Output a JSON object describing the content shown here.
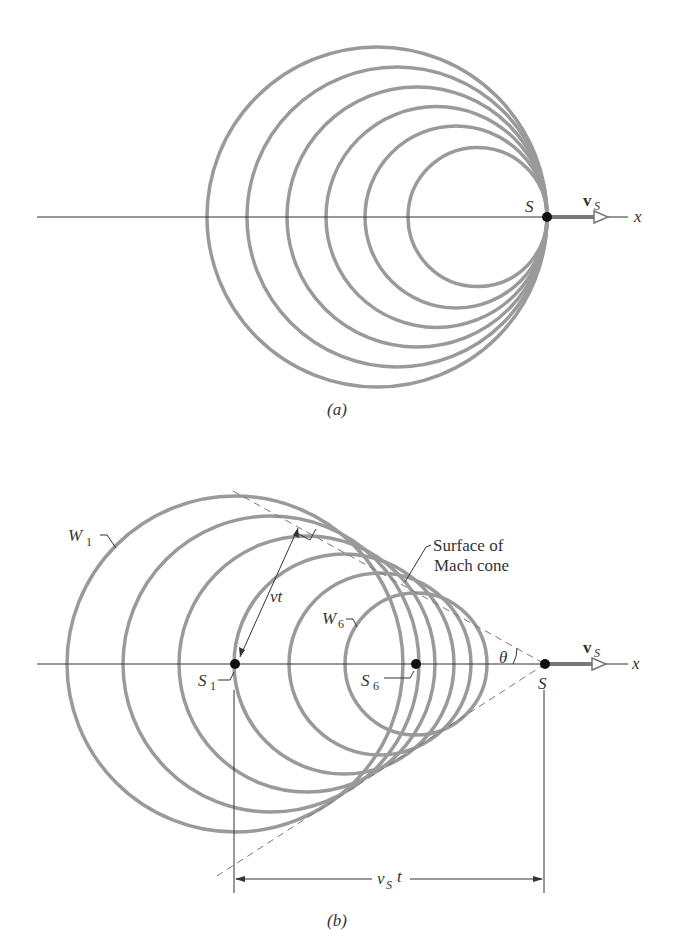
{
  "figure": {
    "panel_a": {
      "caption": "(a)",
      "source_label": "S",
      "velocity_label": "v",
      "velocity_sub": "S",
      "axis_label": "x",
      "wavefront_count": 6
    },
    "panel_b": {
      "caption": "(b)",
      "w1_label": "W",
      "w1_sub": "1",
      "w6_label": "W",
      "w6_sub": "6",
      "s1_label": "S",
      "s1_sub": "1",
      "s6_label": "S",
      "s6_sub": "6",
      "source_label": "S",
      "velocity_label": "v",
      "velocity_sub": "S",
      "axis_label": "x",
      "radius_label": "vt",
      "angle_label": "θ",
      "cone_label_line1": "Surface of",
      "cone_label_line2": "Mach cone",
      "distance_label": "v",
      "distance_sub": "S",
      "distance_tail": "t",
      "wavefront_count": 6
    },
    "colors": {
      "wavefront": "#9a9a9a",
      "axis": "#333333",
      "source_dot": "#111111",
      "dashed": "#777777"
    }
  }
}
